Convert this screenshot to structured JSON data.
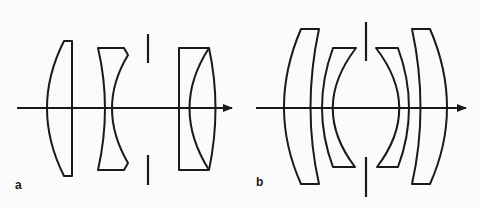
{
  "figure": {
    "panels": [
      {
        "label": "a",
        "description": "Four-element lens: plano-convex front element, concave middle element, aperture stop, cemented doublet rear group",
        "elements": [
          "plano-convex lens",
          "biconcave lens",
          "aperture stop",
          "cemented doublet"
        ]
      },
      {
        "label": "b",
        "description": "Symmetric double-Gauss type: two meniscus elements on each side of a central aperture stop",
        "elements": [
          "outer meniscus",
          "inner meniscus",
          "aperture stop",
          "inner meniscus",
          "outer meniscus"
        ]
      }
    ],
    "colors": {
      "ink": "#1a1a1a",
      "background": "#fbfbfb"
    }
  }
}
